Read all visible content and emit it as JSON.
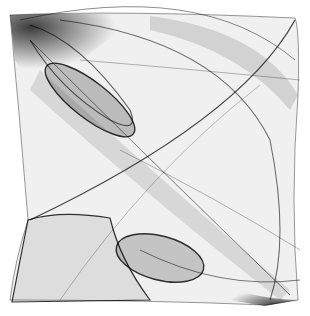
{
  "artwork": {
    "kind": "generative string-art line envelope",
    "background": "#ffffff",
    "ink": "#000000",
    "width": 310,
    "height": 316
  }
}
